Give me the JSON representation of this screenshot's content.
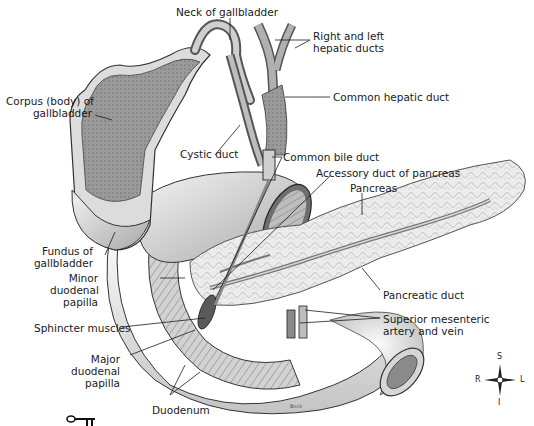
{
  "figure": {
    "artist_signature": "Beck",
    "colors": {
      "line": "#1a1a1a",
      "tissue_light": "#e6e6e6",
      "tissue_mid": "#bdbdbd",
      "tissue_dark": "#7a7a7a",
      "background": "#ffffff"
    }
  },
  "labels": {
    "neck_gallbladder": "Neck of gallbladder",
    "hepatic_ducts_1": "Right and left",
    "hepatic_ducts_2": "hepatic ducts",
    "corpus_1": "Corpus (body) of",
    "corpus_2": "gallbladder",
    "common_hepatic": "Common hepatic duct",
    "cystic_duct": "Cystic duct",
    "common_bile": "Common bile duct",
    "accessory_duct": "Accessory duct of pancreas",
    "pancreas": "Pancreas",
    "fundus_1": "Fundus of",
    "fundus_2": "gallbladder",
    "minor_papilla_1": "Minor",
    "minor_papilla_2": "duodenal",
    "minor_papilla_3": "papilla",
    "pancreatic_duct": "Pancreatic duct",
    "sphincter": "Sphincter muscles",
    "sma_1": "Superior mesenteric",
    "sma_2": "artery and vein",
    "major_papilla_1": "Major",
    "major_papilla_2": "duodenal",
    "major_papilla_3": "papilla",
    "duodenum": "Duodenum"
  },
  "compass": {
    "north": "S",
    "south": "I",
    "west": "R",
    "east": "L"
  },
  "key_icon": "key-icon"
}
